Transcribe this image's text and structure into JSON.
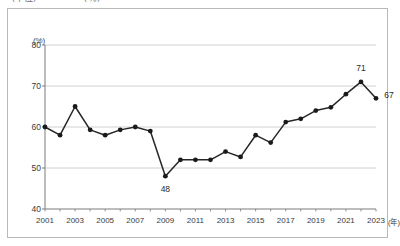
{
  "title_fragment": "（単位）　　　　　（％）",
  "axis": {
    "y_unit": "(%)",
    "x_unit": "(年)",
    "y_ticks": [
      "80",
      "70",
      "60",
      "50",
      "40"
    ],
    "x_ticks": [
      "2001",
      "2003",
      "2005",
      "2007",
      "2009",
      "2011",
      "2013",
      "2015",
      "2017",
      "2019",
      "2021",
      "2023"
    ]
  },
  "annotations": [
    {
      "text": "48",
      "year": 2009,
      "value": 48
    },
    {
      "text": "71",
      "year": 2022,
      "value": 71
    },
    {
      "text": "67",
      "year": 2023,
      "value": 67
    }
  ],
  "colors": {
    "line": "#262626",
    "marker": "#1a1a1a",
    "grid": "#d0d0d0",
    "axis": "#7a7a7a",
    "frame": "#b9b9b9",
    "text": "#3a3a3a"
  },
  "chart_data": {
    "type": "line",
    "title": "",
    "subtitle": "",
    "xlabel": "(年)",
    "ylabel": "(%)",
    "xlim": [
      2001,
      2023
    ],
    "ylim": [
      40,
      80
    ],
    "grid": true,
    "legend": "none",
    "x": [
      2001,
      2002,
      2003,
      2004,
      2005,
      2006,
      2007,
      2008,
      2009,
      2010,
      2011,
      2012,
      2013,
      2014,
      2015,
      2016,
      2017,
      2018,
      2019,
      2020,
      2021,
      2022,
      2023
    ],
    "tick_labels": [
      "2001",
      "",
      "2003",
      "",
      "2005",
      "",
      "2007",
      "",
      "2009",
      "",
      "2011",
      "",
      "2013",
      "",
      "2015",
      "",
      "2017",
      "",
      "2019",
      "",
      "2021",
      "",
      "2023"
    ],
    "series": [
      {
        "name": "比率",
        "values": [
          60,
          58,
          65,
          59.3,
          58,
          59.3,
          60,
          59,
          48,
          52,
          52,
          52,
          54,
          52.7,
          58,
          56.2,
          61.2,
          62,
          64,
          64.8,
          68,
          71,
          67
        ]
      }
    ],
    "data_labels": {
      "2009": "48",
      "2022": "71",
      "2023": "67"
    }
  }
}
